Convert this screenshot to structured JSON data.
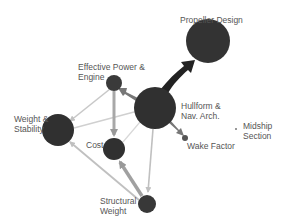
{
  "diagram": {
    "type": "network",
    "colors": {
      "node": "#333333",
      "edge_light": "#c8c8c8",
      "edge_medium": "#a8a8a8",
      "edge_dark": "#222222",
      "label": "#555555"
    },
    "nodes": [
      {
        "id": "propeller",
        "label_lines": [
          "Propeller Design"
        ],
        "cx": 208,
        "cy": 41,
        "r": 22
      },
      {
        "id": "power",
        "label_lines": [
          "Effective Power &",
          "Engine"
        ],
        "cx": 114,
        "cy": 83,
        "r": 8
      },
      {
        "id": "hullform",
        "label_lines": [
          "Hullform &",
          "Nav. Arch."
        ],
        "cx": 155,
        "cy": 108,
        "r": 21
      },
      {
        "id": "weight_stability",
        "label_lines": [
          "Weight &",
          "Stability"
        ],
        "cx": 58,
        "cy": 130,
        "r": 16
      },
      {
        "id": "cost",
        "label_lines": [
          "Cost"
        ],
        "cx": 114,
        "cy": 149,
        "r": 11
      },
      {
        "id": "wake",
        "label_lines": [
          "Wake Factor"
        ],
        "cx": 185,
        "cy": 138,
        "r": 3
      },
      {
        "id": "midship",
        "label_lines": [
          "Midship",
          "Section"
        ],
        "cx": 236,
        "cy": 129,
        "r": 1
      },
      {
        "id": "structural",
        "label_lines": [
          "Structural",
          "Weight"
        ],
        "cx": 147,
        "cy": 204,
        "r": 9
      }
    ],
    "edges": [
      {
        "from": "hullform",
        "to": "propeller",
        "weight": "heavy"
      },
      {
        "from": "hullform",
        "to": "power",
        "weight": "medium"
      },
      {
        "from": "hullform",
        "to": "wake",
        "weight": "medium"
      },
      {
        "from": "power",
        "to": "cost",
        "weight": "medium"
      },
      {
        "from": "power",
        "to": "weight_stability",
        "weight": "light"
      },
      {
        "from": "hullform",
        "to": "weight_stability",
        "weight": "light"
      },
      {
        "from": "hullform",
        "to": "cost",
        "weight": "light"
      },
      {
        "from": "hullform",
        "to": "structural",
        "weight": "light"
      },
      {
        "from": "structural",
        "to": "cost",
        "weight": "medium"
      },
      {
        "from": "structural",
        "to": "weight_stability",
        "weight": "light"
      }
    ]
  },
  "labels": {
    "propeller": "Propeller Design",
    "power_1": "Effective Power &",
    "power_2": "Engine",
    "hullform_1": "Hullform &",
    "hullform_2": "Nav. Arch.",
    "weight_1": "Weight &",
    "weight_2": "Stability",
    "cost": "Cost",
    "wake": "Wake Factor",
    "midship_1": "Midship",
    "midship_2": "Section",
    "structural_1": "Structural",
    "structural_2": "Weight"
  }
}
